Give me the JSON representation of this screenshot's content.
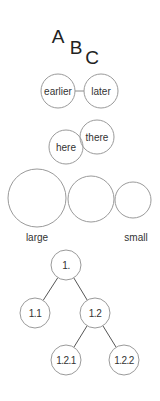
{
  "letters": [
    {
      "text": "A",
      "x": 58,
      "y": 43
    },
    {
      "text": "B",
      "x": 76,
      "y": 54
    },
    {
      "text": "C",
      "x": 92,
      "y": 64
    }
  ],
  "sequence": {
    "nodes": [
      {
        "label": "earlier",
        "cx": 58,
        "cy": 91,
        "r": 17
      },
      {
        "label": "later",
        "cx": 101,
        "cy": 91,
        "r": 17
      }
    ],
    "connector": {
      "x1": 75,
      "y1": 91,
      "x2": 84,
      "y2": 91
    }
  },
  "overlap": {
    "nodes": [
      {
        "label": "here",
        "cx": 66,
        "cy": 147,
        "r": 17
      },
      {
        "label": "there",
        "cx": 97,
        "cy": 137,
        "r": 17
      }
    ]
  },
  "sizes": {
    "circles": [
      {
        "cx": 37,
        "cy": 198,
        "r": 29
      },
      {
        "cx": 91,
        "cy": 199,
        "r": 23
      },
      {
        "cx": 133,
        "cy": 200,
        "r": 18
      }
    ],
    "labels": [
      {
        "text": "large",
        "x": 37,
        "y": 241
      },
      {
        "text": "small",
        "x": 136,
        "y": 241
      }
    ]
  },
  "tree": {
    "nodes": [
      {
        "id": "n1",
        "label": "1.",
        "cx": 66,
        "cy": 265,
        "r": 15
      },
      {
        "id": "n11",
        "label": "1.1",
        "cx": 35,
        "cy": 313,
        "r": 15
      },
      {
        "id": "n12",
        "label": "1.2",
        "cx": 95,
        "cy": 313,
        "r": 15
      },
      {
        "id": "n121",
        "label": "1.2.1",
        "cx": 66,
        "cy": 360,
        "r": 15
      },
      {
        "id": "n122",
        "label": "1.2.2",
        "cx": 124,
        "cy": 360,
        "r": 15
      }
    ],
    "edges": [
      {
        "from": "n1",
        "to": "n11"
      },
      {
        "from": "n1",
        "to": "n12"
      },
      {
        "from": "n12",
        "to": "n121"
      },
      {
        "from": "n12",
        "to": "n122"
      }
    ]
  },
  "colors": {
    "circle_stroke": "#9a9a9a",
    "edge_stroke": "#555555",
    "text": "#333333",
    "background": "#ffffff"
  }
}
